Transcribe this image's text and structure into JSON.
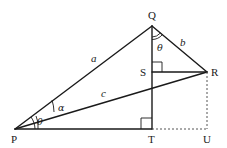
{
  "diagram": {
    "type": "geometry",
    "points": {
      "P": {
        "label": "P",
        "x": 15,
        "y": 129
      },
      "Q": {
        "label": "Q",
        "x": 152,
        "y": 26
      },
      "R": {
        "label": "R",
        "x": 207,
        "y": 72
      },
      "S": {
        "label": "S",
        "x": 152,
        "y": 72
      },
      "T": {
        "label": "T",
        "x": 152,
        "y": 129
      },
      "U": {
        "label": "U",
        "x": 207,
        "y": 129
      }
    },
    "segments": [
      {
        "from": "P",
        "to": "Q",
        "label": "a",
        "style": "solid"
      },
      {
        "from": "Q",
        "to": "R",
        "label": "b",
        "style": "solid"
      },
      {
        "from": "P",
        "to": "R",
        "label": "c",
        "style": "solid"
      },
      {
        "from": "Q",
        "to": "T",
        "style": "solid"
      },
      {
        "from": "S",
        "to": "R",
        "style": "solid"
      },
      {
        "from": "P",
        "to": "T",
        "style": "solid"
      },
      {
        "from": "T",
        "to": "U",
        "style": "dashed"
      },
      {
        "from": "R",
        "to": "U",
        "style": "dashed"
      }
    ],
    "edge_labels": {
      "a": "a",
      "b": "b",
      "c": "c"
    },
    "angles": {
      "alpha": {
        "label": "α",
        "at": "P",
        "between": [
          "PR",
          "PQ"
        ]
      },
      "theta_P": {
        "label": "θ",
        "at": "P",
        "between": [
          "PT",
          "PR"
        ]
      },
      "theta_Q": {
        "label": "θ",
        "at": "Q",
        "between": [
          "QT",
          "QR"
        ]
      }
    },
    "right_angles": [
      "S",
      "T"
    ]
  }
}
